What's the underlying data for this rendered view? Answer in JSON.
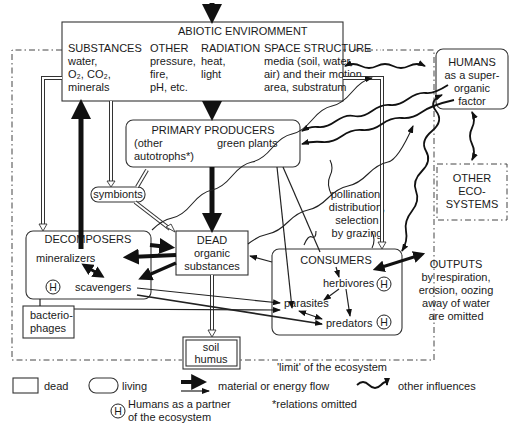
{
  "abiotic": {
    "title": "ABIOTIC ENVIROMMENT",
    "substances": {
      "heading": "SUBSTANCES",
      "line1": "water,",
      "line2": "O₂, CO₂,",
      "line3": "minerals"
    },
    "other": {
      "heading": "OTHER",
      "line1": "pressure,",
      "line2": "fire,",
      "line3": "pH, etc."
    },
    "radiation": {
      "heading": "RADIATION",
      "line1": "heat,",
      "line2": "light"
    },
    "space": {
      "heading": "SPACE STRUCTURE",
      "line1": "media (soil, water,",
      "line2": "air) and their motion,",
      "line3": "area, substratum"
    }
  },
  "humans_box": {
    "line1": "HUMANS",
    "line2": "as a super-",
    "line3": "organic",
    "line4": "factor"
  },
  "producers": {
    "title": "PRIMARY PRODUCERS",
    "left1": "(other",
    "left2": "autotrophs*)",
    "right": "green plants"
  },
  "symbionts": {
    "label": "symbionts"
  },
  "other_ecosystems": {
    "line1": "OTHER",
    "line2": "ECO-",
    "line3": "SYSTEMS"
  },
  "pollination_note": {
    "line1": "pollination,",
    "line2": "distribution,",
    "line3": "selection",
    "line4": "by grazing"
  },
  "decomposers": {
    "title": "DECOMPOSERS",
    "mineralizers": "mineralizers",
    "scavengers": "scavengers",
    "human_mark": "H"
  },
  "dead": {
    "line1": "DEAD",
    "line2": "organic",
    "line3": "substances"
  },
  "consumers": {
    "title": "CONSUMERS",
    "herbivores": "herbivores",
    "parasites": "parasites",
    "predators": "predators",
    "human_mark": "H"
  },
  "outputs": {
    "line1": "OUTPUTS",
    "line2": "by respiration,",
    "line3": "erosion, oozing",
    "line4": "away of water",
    "line5": "are omitted"
  },
  "bacteriophages": {
    "line1": "bacterio-",
    "line2": "phages"
  },
  "soil_humus": {
    "line1": "soil",
    "line2": "humus"
  },
  "limit_label": "'limit' of the ecosystem",
  "legend": {
    "dead": "dead",
    "living": "living",
    "flow": "material or energy flow",
    "other": "other influences",
    "human_mark": "H",
    "humans_partner1": "Humans as a partner",
    "humans_partner2": "of the ecosystem",
    "relations": "*relations omitted"
  }
}
